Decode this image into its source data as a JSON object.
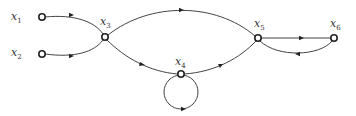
{
  "diagram": {
    "type": "signal-flow-graph",
    "nodes": [
      {
        "id": "x1",
        "label": "x",
        "sub": "1",
        "cx": 42,
        "cy": 17
      },
      {
        "id": "x2",
        "label": "x",
        "sub": "2",
        "cx": 42,
        "cy": 54
      },
      {
        "id": "x3",
        "label": "x",
        "sub": "3",
        "cx": 105,
        "cy": 37
      },
      {
        "id": "x4",
        "label": "x",
        "sub": "4",
        "cx": 181,
        "cy": 74
      },
      {
        "id": "x5",
        "label": "x",
        "sub": "5",
        "cx": 258,
        "cy": 38
      },
      {
        "id": "x6",
        "label": "x",
        "sub": "6",
        "cx": 334,
        "cy": 38
      }
    ],
    "edges": [
      {
        "from": "x1",
        "to": "x3"
      },
      {
        "from": "x2",
        "to": "x3"
      },
      {
        "from": "x3",
        "to": "x5",
        "path": "upper arc"
      },
      {
        "from": "x3",
        "to": "x4"
      },
      {
        "from": "x4",
        "to": "x5"
      },
      {
        "from": "x4",
        "to": "x4",
        "path": "self-loop"
      },
      {
        "from": "x5",
        "to": "x6"
      },
      {
        "from": "x6",
        "to": "x5",
        "path": "lower arc"
      }
    ]
  }
}
